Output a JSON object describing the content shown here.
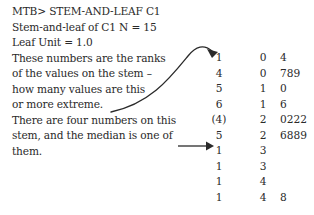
{
  "command": "MTB> STEM-AND-LEAF C1",
  "header": {
    "title_line": "Stem-and-leaf of C1 N = 15",
    "leaf_unit": "Leaf Unit = 1.0"
  },
  "annotations": {
    "ranks_note": [
      "These numbers are the ranks",
      "of the values on the stem –",
      "how many values are this",
      "or more extreme."
    ],
    "median_note": [
      "There are four numbers on this",
      "stem, and the median is one of",
      "them."
    ]
  },
  "display": {
    "columns": [
      "rank",
      "stem",
      "leaf"
    ],
    "rows": [
      {
        "rank": "1",
        "stem": "0",
        "leaf": "4"
      },
      {
        "rank": "4",
        "stem": "0",
        "leaf": "789"
      },
      {
        "rank": "5",
        "stem": "1",
        "leaf": "0"
      },
      {
        "rank": "6",
        "stem": "1",
        "leaf": "6"
      },
      {
        "rank": "(4)",
        "stem": "2",
        "leaf": "0222"
      },
      {
        "rank": "5",
        "stem": "2",
        "leaf": "6889"
      },
      {
        "rank": "1",
        "stem": "3",
        "leaf": ""
      },
      {
        "rank": "1",
        "stem": "3",
        "leaf": ""
      },
      {
        "rank": "1",
        "stem": "4",
        "leaf": ""
      },
      {
        "rank": "1",
        "stem": "4",
        "leaf": "8"
      }
    ]
  },
  "colors": {
    "text": "#2a2a2a",
    "background": "#ffffff",
    "arrow": "#2a2a2a"
  }
}
